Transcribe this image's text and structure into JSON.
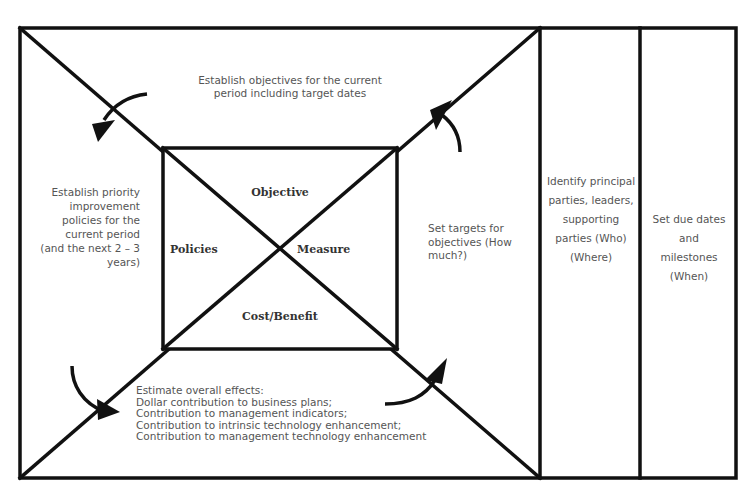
{
  "diagram": {
    "top_text": "Establish objectives for the current period including target dates",
    "left_text": "Establish priority improvement policies for the current period (and the next 2 – 3 years)",
    "right_text": "Set targets for objectives (How much?)",
    "bottom_text": {
      "title": "Estimate overall effects:",
      "lines": [
        "Dollar contribution to business plans;",
        "Contribution to management indicators;",
        "Contribution to intrinsic technology enhancement;",
        "Contribution to management technology enhancement"
      ]
    },
    "inner_labels": {
      "top": "Objective",
      "left": "Policies",
      "right": "Measure",
      "bottom": "Cost/Benefit"
    },
    "columns": [
      {
        "text": "Identify principal parties, leaders, supporting parties (Who) (Where)"
      },
      {
        "text": "Set due dates and milestones (When)"
      }
    ],
    "colors": {
      "line": "#111111",
      "text": "#555555",
      "bold_text": "#333333"
    }
  }
}
